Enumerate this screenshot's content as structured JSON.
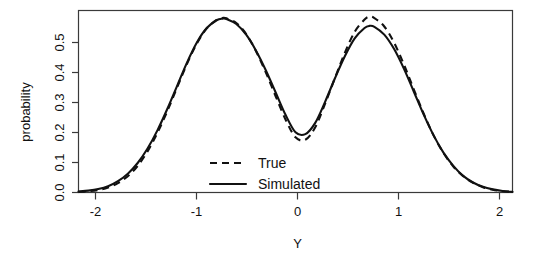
{
  "chart_data": {
    "type": "line",
    "title": "",
    "xlabel": "Y",
    "ylabel": "probability",
    "xlim": [
      -2.2,
      2.2
    ],
    "ylim": [
      0.0,
      0.58
    ],
    "grid": false,
    "legend_position": "center",
    "x_ticks": [
      "-2",
      "-1",
      "0",
      "1",
      "2"
    ],
    "x_tick_values": [
      -2,
      -1,
      0,
      1,
      2
    ],
    "y_ticks": [
      "0.0",
      "0.1",
      "0.2",
      "0.3",
      "0.4",
      "0.5"
    ],
    "y_tick_values": [
      0.0,
      0.1,
      0.2,
      0.3,
      0.4,
      0.5
    ],
    "x": [
      -2.2,
      -2.1,
      -2.0,
      -1.9,
      -1.8,
      -1.7,
      -1.6,
      -1.5,
      -1.4,
      -1.3,
      -1.2,
      -1.1,
      -1.0,
      -0.9,
      -0.8,
      -0.74,
      -0.7,
      -0.6,
      -0.5,
      -0.4,
      -0.3,
      -0.2,
      -0.1,
      0.0,
      0.1,
      0.2,
      0.3,
      0.4,
      0.5,
      0.6,
      0.7,
      0.75,
      0.8,
      0.9,
      1.0,
      1.1,
      1.2,
      1.3,
      1.4,
      1.5,
      1.6,
      1.7,
      1.8,
      1.9,
      2.0,
      2.1,
      2.2
    ],
    "series": [
      {
        "name": "True",
        "style": "dashed",
        "color": "#111111",
        "values": [
          0.002,
          0.004,
          0.008,
          0.016,
          0.03,
          0.052,
          0.085,
          0.131,
          0.19,
          0.259,
          0.335,
          0.41,
          0.475,
          0.523,
          0.55,
          0.556,
          0.555,
          0.54,
          0.505,
          0.45,
          0.382,
          0.306,
          0.232,
          0.176,
          0.168,
          0.208,
          0.283,
          0.365,
          0.445,
          0.512,
          0.551,
          0.56,
          0.556,
          0.529,
          0.477,
          0.407,
          0.328,
          0.251,
          0.182,
          0.126,
          0.083,
          0.052,
          0.031,
          0.017,
          0.009,
          0.004,
          0.002
        ]
      },
      {
        "name": "Simulated",
        "style": "solid",
        "color": "#111111",
        "values": [
          0.003,
          0.006,
          0.011,
          0.02,
          0.036,
          0.06,
          0.094,
          0.14,
          0.198,
          0.266,
          0.34,
          0.414,
          0.478,
          0.524,
          0.549,
          0.554,
          0.553,
          0.537,
          0.503,
          0.452,
          0.389,
          0.318,
          0.247,
          0.192,
          0.186,
          0.222,
          0.289,
          0.364,
          0.434,
          0.491,
          0.524,
          0.531,
          0.528,
          0.503,
          0.457,
          0.394,
          0.321,
          0.248,
          0.182,
          0.127,
          0.085,
          0.053,
          0.032,
          0.018,
          0.01,
          0.005,
          0.002
        ]
      }
    ],
    "legend_entries": [
      {
        "label": "True",
        "style": "dashed"
      },
      {
        "label": "Simulated",
        "style": "solid"
      }
    ]
  },
  "axes": {
    "y_title": "probability",
    "x_title": "Y"
  },
  "legend": {
    "true_label": "True",
    "simulated_label": "Simulated"
  }
}
